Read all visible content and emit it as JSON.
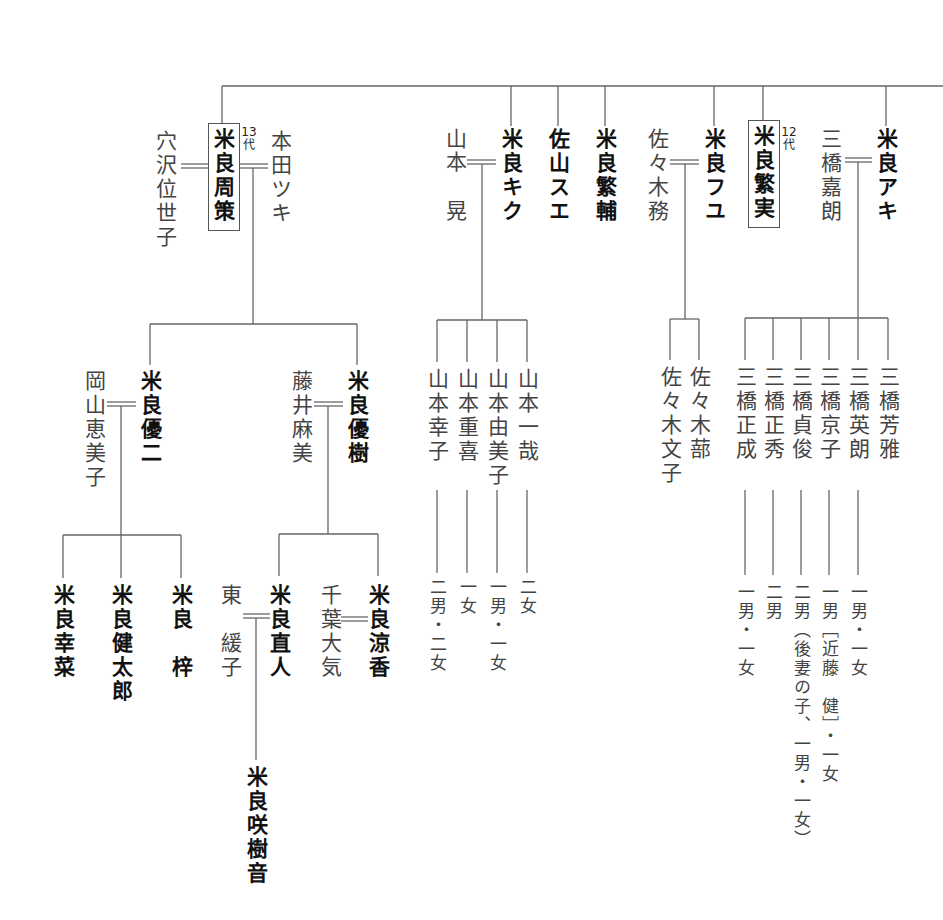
{
  "chart_title": "",
  "generation_labels": {
    "shusaku": "13代",
    "shigezane": "12代"
  },
  "generation1": {
    "shusaku": {
      "name": "米良周策",
      "boxed": true,
      "generation": "13代"
    },
    "shusaku_wife_left": "穴沢位世子",
    "shusaku_wife_right": "本田ツキ",
    "kiku": "米良キク",
    "kiku_spouse": "山本 晃",
    "sue": "佐山スエ",
    "shigesuke": "米良繁輔",
    "fuyu": "米良フユ",
    "fuyu_spouse": "佐々木務",
    "shigezane": {
      "name": "米良繁実",
      "boxed": true,
      "generation": "12代"
    },
    "aki": "米良アキ",
    "aki_spouse": "三橋嘉朗"
  },
  "generation2": {
    "yuji": "米良優二",
    "yuji_spouse": "岡山恵美子",
    "yuki": "米良優樹",
    "yuki_spouse": "藤井麻美",
    "yamamoto_children": [
      {
        "name": "山本幸子",
        "note": "二男・二女"
      },
      {
        "name": "山本重喜",
        "note": "一女"
      },
      {
        "name": "山本由美子",
        "note": "一男・一女"
      },
      {
        "name": "山本一哉",
        "note": "二女"
      }
    ],
    "sasaki_children": [
      {
        "name": "佐々木文子"
      },
      {
        "name": "佐々木蔀"
      }
    ],
    "mitsuhashi_children": [
      {
        "name": "三橋正成",
        "note": "一男・一女"
      },
      {
        "name": "三橋正秀",
        "note": "二男"
      },
      {
        "name": "三橋貞俊",
        "note": "二男（後妻の子、一男・一女）"
      },
      {
        "name": "三橋京子",
        "note": "一男［近藤　健］・一女"
      },
      {
        "name": "三橋英朗",
        "note": "一男・一女"
      },
      {
        "name": "三橋芳雅",
        "note": ""
      }
    ]
  },
  "generation3": {
    "yuji_children": [
      "米良幸菜",
      "米良健太郎",
      "米良　梓"
    ],
    "naoto": "米良直人",
    "naoto_spouse": "東　緩子",
    "ryoka": "米良涼香",
    "ryoka_spouse": "千葉大気"
  },
  "generation4": {
    "sakine": "米良咲樹音"
  },
  "colors": {
    "line": "#555555",
    "text": "#1a1a1a",
    "spouse_text": "#444444"
  }
}
